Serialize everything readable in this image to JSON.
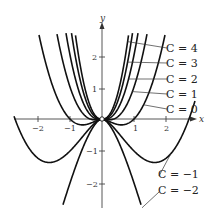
{
  "chart_data": {
    "type": "line",
    "title": "",
    "function": "y = x^2 (ln|x| + C)",
    "xlabel": "x",
    "ylabel": "y",
    "xlim": [
      -2.75,
      2.9
    ],
    "ylim": [
      -2.8,
      2.7
    ],
    "x_ticks": [
      -2,
      -1,
      1,
      2
    ],
    "x_tick_labels": [
      "−2",
      "−1",
      "1",
      "2"
    ],
    "y_ticks": [
      -2,
      -1,
      1,
      2
    ],
    "y_tick_labels": [
      "−2",
      "−1",
      "1",
      "2"
    ],
    "grid": false,
    "series": [
      {
        "name": "C = 4",
        "C": 4
      },
      {
        "name": "C = 3",
        "C": 3
      },
      {
        "name": "C = 2",
        "C": 2
      },
      {
        "name": "C = 1",
        "C": 1
      },
      {
        "name": "C = 0",
        "C": 0
      },
      {
        "name": "C = −1",
        "C": -1
      },
      {
        "name": "C = −2",
        "C": -2
      }
    ],
    "annotations": [
      {
        "text": "C = 4",
        "label_pos": [
          166,
          48
        ],
        "anchor_x": 0.8
      },
      {
        "text": "C = 3",
        "label_pos": [
          166,
          63
        ],
        "anchor_x": 0.8
      },
      {
        "text": "C = 2",
        "label_pos": [
          166,
          79
        ],
        "anchor_x": 0.83
      },
      {
        "text": "C = 1",
        "label_pos": [
          166,
          94
        ],
        "anchor_x": 0.95
      },
      {
        "text": "C = 0",
        "label_pos": [
          166,
          109
        ],
        "anchor_x": 1.3
      },
      {
        "text": "C = −1",
        "label_pos": [
          158,
          176
        ],
        "anchor_x": 2.15
      },
      {
        "text": "C = −2",
        "label_pos": [
          158,
          192
        ],
        "anchor_x": 1.25
      }
    ]
  },
  "labels": {
    "x_axis": "x",
    "y_axis": "y",
    "c4": "C = 4",
    "c3": "C = 3",
    "c2": "C = 2",
    "c1": "C = 1",
    "c0": "C = 0",
    "cm1": "C = −1",
    "cm2": "C = −2",
    "xt_m2": "−2",
    "xt_m1": "−1",
    "xt_1": "1",
    "xt_2": "2",
    "yt_2": "2",
    "yt_1": "1",
    "yt_m1": "−1",
    "yt_m2": "−2"
  }
}
